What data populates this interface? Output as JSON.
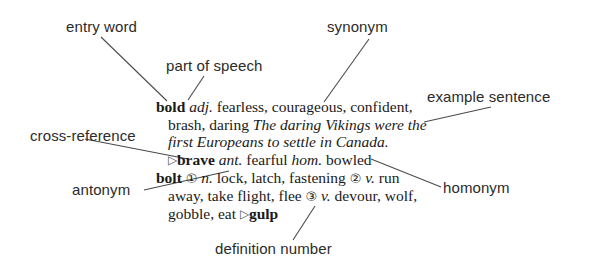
{
  "figure": {
    "background_color": "#ffffff",
    "label_color": "#2b2b2b",
    "entry_color": "#1a1a1a",
    "leader_line_color": "#4a4a4a"
  },
  "labels": {
    "entry_word": "entry word",
    "part_of_speech": "part of speech",
    "synonym": "synonym",
    "example_sentence": "example sentence",
    "cross_reference": "cross-reference",
    "antonym": "antonym",
    "homonym": "homonym",
    "definition_number": "definition number"
  },
  "entry": {
    "line1": {
      "headword": "bold",
      "pos": "adj.",
      "synonyms": "fearless, courageous, confident,"
    },
    "line2": {
      "synonyms_cont": "brash, daring",
      "example_part1": "The daring Vikings were the"
    },
    "line3": {
      "example_part2": "first Europeans to settle in Canada."
    },
    "line4": {
      "bullet": "▷",
      "cross_reference_word": "brave",
      "ant_label": "ant.",
      "antonym_word": "fearful",
      "hom_label": "hom.",
      "homonym_word": "bowled"
    },
    "line5": {
      "headword": "bolt",
      "number1": "①",
      "pos1": "n.",
      "defs1": "lock, latch, fastening",
      "number2": "②",
      "pos2": "v.",
      "defs2_start": "run"
    },
    "line6": {
      "defs2_cont": "away, take flight, flee",
      "number3": "③",
      "pos3": "v.",
      "defs3_start": "devour, wolf,"
    },
    "line7": {
      "defs3_cont": "gobble, eat",
      "bullet": "▷",
      "cross_reference_word": "gulp"
    }
  }
}
